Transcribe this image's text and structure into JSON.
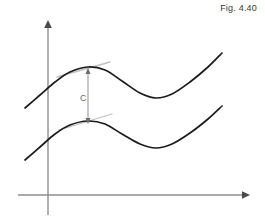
{
  "figure": {
    "caption": "Fig. 4.40",
    "background_color": "#ffffff",
    "curve_color": "#1c1c1c",
    "axis_color": "#8d8d8d",
    "tangent_color": "#c0c0c0",
    "label_color": "#6b6b6b"
  },
  "chart_data": {
    "type": "line",
    "title": "Fig. 4.40",
    "xlabel": "",
    "ylabel": "",
    "grid": false,
    "legend": null,
    "axes": {
      "x_axis": {
        "y_pixel": 195,
        "x_start": 18,
        "x_end": 248,
        "arrow": "right"
      },
      "y_axis": {
        "x_pixel": 48,
        "y_start": 215,
        "y_end": 20,
        "arrow": "up"
      },
      "origin": [
        48,
        195
      ]
    },
    "series": [
      {
        "name": "upper-curve",
        "points": [
          [
            25,
            108
          ],
          [
            40,
            95
          ],
          [
            55,
            82
          ],
          [
            70,
            72
          ],
          [
            88,
            67
          ],
          [
            105,
            70
          ],
          [
            122,
            81
          ],
          [
            140,
            93
          ],
          [
            156,
            98
          ],
          [
            172,
            94
          ],
          [
            190,
            82
          ],
          [
            208,
            67
          ],
          [
            222,
            53
          ]
        ]
      },
      {
        "name": "lower-curve",
        "points": [
          [
            25,
            160
          ],
          [
            40,
            147
          ],
          [
            55,
            134
          ],
          [
            70,
            125
          ],
          [
            88,
            121
          ],
          [
            105,
            124
          ],
          [
            122,
            134
          ],
          [
            140,
            144
          ],
          [
            156,
            148
          ],
          [
            172,
            144
          ],
          [
            190,
            133
          ],
          [
            208,
            119
          ],
          [
            222,
            106
          ]
        ]
      }
    ],
    "tangents": [
      {
        "name": "upper-peak-tangent",
        "x1": 57,
        "y1": 77,
        "x2": 110,
        "y2": 62
      },
      {
        "name": "lower-peak-tangent",
        "x1": 59,
        "y1": 130,
        "x2": 112,
        "y2": 114
      }
    ],
    "annotations": [
      {
        "name": "constant-offset",
        "label": "C",
        "label_x": 80,
        "label_y": 101,
        "line_x": 88,
        "line_y_top": 69,
        "line_y_bottom": 123,
        "arrow_both_ends": true
      }
    ]
  }
}
